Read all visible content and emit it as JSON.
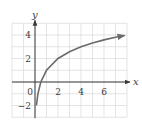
{
  "chart_data": {
    "type": "line",
    "title": "",
    "xlabel": "x",
    "ylabel": "y",
    "xlim": [
      -2,
      8
    ],
    "ylim": [
      -3,
      5
    ],
    "grid": true,
    "grid_step": 1,
    "x_ticks": [
      0,
      2,
      4,
      6
    ],
    "x_tick_labels": [
      "2",
      "4",
      "6"
    ],
    "origin_label": "0",
    "y_ticks": [
      -2,
      2,
      4
    ],
    "y_tick_labels": [
      "−2",
      "2",
      "4"
    ],
    "series": [
      {
        "name": "y = 1 + log2(x)",
        "x": [
          0.125,
          0.25,
          0.5,
          1,
          2,
          3,
          4,
          5,
          6,
          7,
          7.8
        ],
        "values": [
          -2,
          -1,
          0,
          1,
          2,
          2.58,
          3,
          3.32,
          3.58,
          3.81,
          3.96
        ],
        "arrow_end": true,
        "color": "#6b6b6b"
      }
    ],
    "colors": {
      "grid": "#d9d9d9",
      "axis": "#3a3a3a",
      "curve": "#6b6b6b"
    }
  }
}
